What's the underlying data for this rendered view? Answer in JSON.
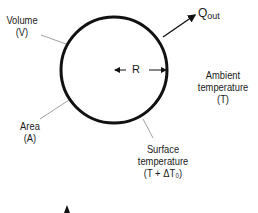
{
  "diagram": {
    "sphere": {
      "label_radius": "R",
      "stroke_color": "#111111"
    },
    "labels": {
      "volume": {
        "line1": "Volume",
        "line2": "(V)"
      },
      "area": {
        "line1": "Area",
        "line2": "(A)"
      },
      "surface_temperature": {
        "line1": "Surface",
        "line2": "temperature",
        "line3": "(T + ΔT₀)"
      },
      "ambient_temperature": {
        "line1": "Ambient",
        "line2": "temperature",
        "line3": "(T)"
      },
      "heat_flow": {
        "symbol": "Q",
        "subscript": "out"
      }
    },
    "leader_line_color": "#888888"
  }
}
